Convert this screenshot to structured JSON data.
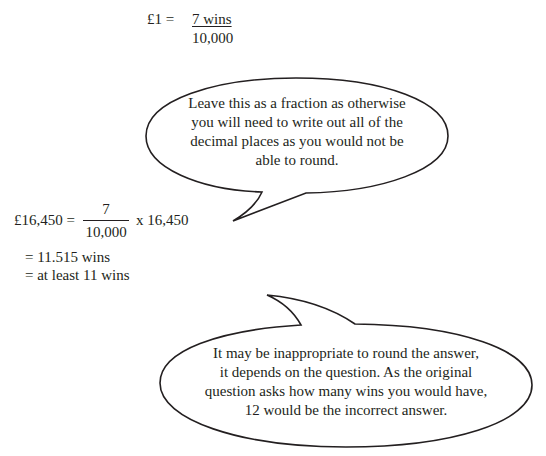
{
  "rate_equation": {
    "lhs": "£1 =",
    "numerator": "7 wins",
    "denominator": "10,000"
  },
  "calculation": {
    "lhs": "£16,450 =",
    "numerator": "7",
    "denominator": "10,000",
    "multiplier": "x 16,450",
    "result_lines": [
      "= 11.515 wins",
      "= at least 11 wins"
    ]
  },
  "callouts": [
    {
      "lines": [
        "Leave this as a fraction as otherwise",
        "you will need to write out all of the",
        "decimal places as you would not be",
        "able to round."
      ]
    },
    {
      "lines": [
        "It may be inappropriate to round the answer,",
        "it depends on the question.  As the original",
        "question asks how many wins you would have,",
        "12 would be the incorrect answer."
      ]
    }
  ]
}
